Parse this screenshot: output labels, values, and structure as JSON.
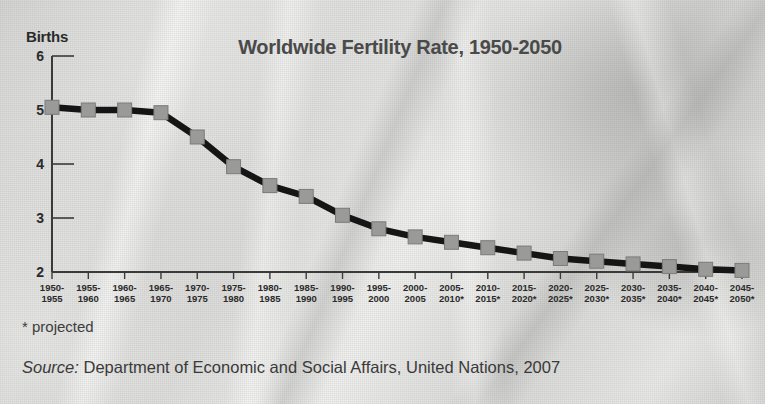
{
  "figure": {
    "y_axis_title": "Births",
    "footnote": "* projected",
    "source_lead": "Source:",
    "source_text": " Department of Economic and Social Affairs, United Nations, 2007",
    "line_color": "#151515",
    "marker_color": "#9a9a98",
    "marker_border": "#7b7b79",
    "axis_color": "#3a3a3a",
    "title_color": "#4a4a4a"
  },
  "chart_data": {
    "type": "line",
    "title": "Worldwide Fertility Rate, 1950-2050",
    "xlabel": "",
    "ylabel": "Births",
    "ylim": [
      2,
      6
    ],
    "yticks": [
      2,
      3,
      4,
      5,
      6
    ],
    "ytick_labels": [
      "2",
      "3",
      "4",
      "5",
      "6"
    ],
    "grid": false,
    "legend": "none",
    "categories": [
      "1950-\n1955",
      "1955-\n1960",
      "1960-\n1965",
      "1965-\n1970",
      "1970-\n1975",
      "1975-\n1980",
      "1980-\n1985",
      "1985-\n1990",
      "1990-\n1995",
      "1995-\n2000",
      "2000-\n2005",
      "2005-\n2010*",
      "2010-\n2015*",
      "2015-\n2020*",
      "2020-\n2025*",
      "2025-\n2030*",
      "2030-\n2035*",
      "2035-\n2040*",
      "2040-\n2045*",
      "2045-\n2050*"
    ],
    "values": [
      5.05,
      5.0,
      5.0,
      4.95,
      4.5,
      3.95,
      3.6,
      3.4,
      3.05,
      2.8,
      2.65,
      2.55,
      2.45,
      2.35,
      2.25,
      2.2,
      2.15,
      2.1,
      2.05,
      2.03
    ],
    "projected_from_index": 11,
    "annotations": [
      "* projected"
    ]
  }
}
